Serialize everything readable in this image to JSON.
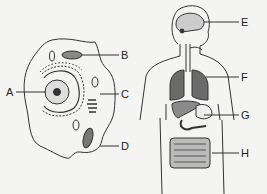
{
  "diagram": {
    "left_panel": "animal-cell",
    "right_panel": "human-body-organs",
    "labels": [
      {
        "id": "A",
        "text": "A",
        "x": 14,
        "y": 87
      },
      {
        "id": "B",
        "text": "B",
        "x": 121,
        "y": 50
      },
      {
        "id": "C",
        "text": "C",
        "x": 121,
        "y": 89
      },
      {
        "id": "D",
        "text": "D",
        "x": 121,
        "y": 141
      },
      {
        "id": "E",
        "text": "E",
        "x": 241,
        "y": 17
      },
      {
        "id": "F",
        "text": "F",
        "x": 241,
        "y": 72
      },
      {
        "id": "G",
        "text": "G",
        "x": 241,
        "y": 110
      },
      {
        "id": "H",
        "text": "H",
        "x": 241,
        "y": 148
      }
    ],
    "colors": {
      "line": "#333333",
      "organ_dark": "#6b6b6b",
      "organ_mid": "#8a8a8a",
      "background": "#f4f4f2"
    }
  }
}
